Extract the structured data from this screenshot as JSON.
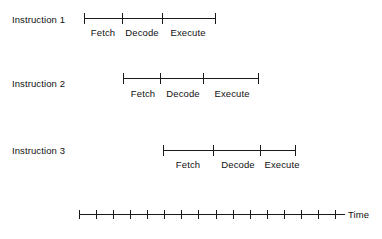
{
  "figure": {
    "background_color": "#ffffff",
    "line_color": "#1a1a1a",
    "text_color": "#111111"
  },
  "chart_data": {
    "type": "timeline",
    "title": "",
    "xlabel": "Time",
    "ylabel": "",
    "grid": false,
    "legend": "none",
    "axis": {
      "label": "Time",
      "label_x": 348,
      "label_y": 209,
      "y": 214,
      "x_start": 79,
      "x_end": 345,
      "tick_count": 16,
      "tick_spacing": 17.1,
      "tick_positions": [
        79,
        96,
        113,
        130,
        147,
        164,
        181,
        198,
        216,
        233,
        250,
        267,
        284,
        301,
        318,
        335
      ]
    },
    "rows": [
      {
        "id": "instruction-1",
        "label": "Instruction 1",
        "label_x": 12,
        "label_y": 14,
        "line_y": 13,
        "x_start": 84,
        "x_end": 215,
        "tick_positions": [
          84,
          122,
          162,
          215
        ],
        "stages": [
          {
            "name": "Fetch",
            "x_start": 84,
            "x_end": 122,
            "center": 103,
            "label_y": 27
          },
          {
            "name": "Decode",
            "x_start": 122,
            "x_end": 162,
            "center": 142,
            "label_y": 27
          },
          {
            "name": "Execute",
            "x_start": 162,
            "x_end": 215,
            "center": 188,
            "label_y": 27
          }
        ]
      },
      {
        "id": "instruction-2",
        "label": "Instruction 2",
        "label_x": 12,
        "label_y": 78,
        "line_y": 73,
        "x_start": 123,
        "x_end": 258,
        "tick_positions": [
          123,
          160,
          203,
          258
        ],
        "stages": [
          {
            "name": "Fetch",
            "x_start": 123,
            "x_end": 160,
            "center": 143,
            "label_y": 88
          },
          {
            "name": "Decode",
            "x_start": 160,
            "x_end": 203,
            "center": 183,
            "label_y": 88
          },
          {
            "name": "Execute",
            "x_start": 203,
            "x_end": 258,
            "center": 232,
            "label_y": 88
          }
        ]
      },
      {
        "id": "instruction-3",
        "label": "Instruction 3",
        "label_x": 12,
        "label_y": 145,
        "line_y": 145,
        "x_start": 163,
        "x_end": 295,
        "tick_positions": [
          163,
          213,
          260,
          295
        ],
        "stages": [
          {
            "name": "Fetch",
            "x_start": 163,
            "x_end": 213,
            "center": 188,
            "label_y": 159
          },
          {
            "name": "Decode",
            "x_start": 213,
            "x_end": 260,
            "center": 238,
            "label_y": 159
          },
          {
            "name": "Execute",
            "x_start": 260,
            "x_end": 295,
            "center": 282,
            "label_y": 159
          }
        ]
      }
    ]
  }
}
